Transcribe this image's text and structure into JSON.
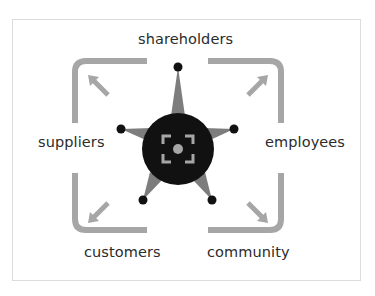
{
  "diagram": {
    "labels": {
      "top": "shareholders",
      "left": "suppliers",
      "right": "employees",
      "bottom_left": "customers",
      "bottom_right": "community"
    },
    "colors": {
      "bracket": "#a6a6a6",
      "star": "#7d7d7d",
      "circle": "#111111",
      "dot": "#111111",
      "icon": "#a6a6a6",
      "text": "#2b2b2b",
      "frame_border": "#dcdcdc"
    },
    "center_icon": "focus-target-icon"
  }
}
